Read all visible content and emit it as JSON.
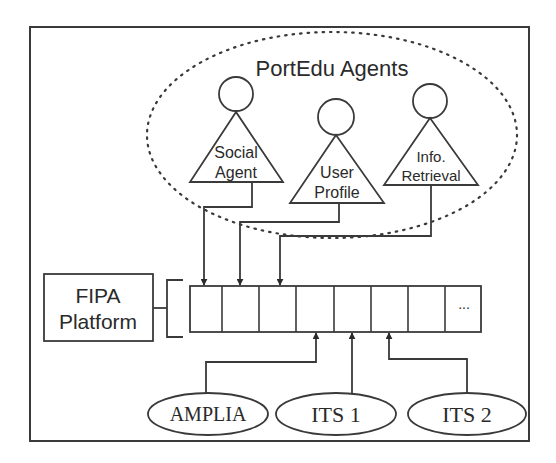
{
  "diagram": {
    "group": {
      "title": "PortEdu Agents"
    },
    "agents": [
      {
        "line1": "Social",
        "line2": "Agent"
      },
      {
        "line1": "User",
        "line2": "Profile"
      },
      {
        "line1": "Info.",
        "line2": "Retrieval"
      }
    ],
    "platform": {
      "line1": "FIPA",
      "line2": "Platform"
    },
    "queue": {
      "cell_count": 8,
      "ellipsis": "..."
    },
    "systems": [
      {
        "label": "AMPLIA"
      },
      {
        "label": "ITS 1"
      },
      {
        "label": "ITS 2"
      }
    ],
    "colors": {
      "line": "#3a3a3a",
      "background": "#ffffff"
    }
  }
}
